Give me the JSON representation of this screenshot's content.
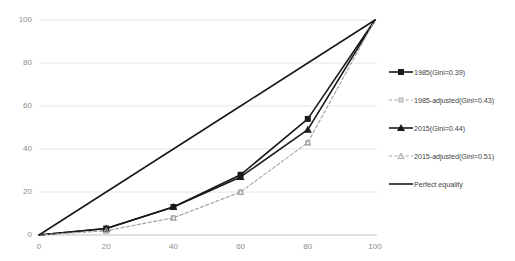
{
  "chart_data": {
    "type": "line",
    "title": "",
    "subtitle": "",
    "xlabel": "",
    "ylabel": "",
    "xlim": [
      0,
      100
    ],
    "ylim": [
      0,
      100
    ],
    "xticks": [
      "0",
      "20",
      "40",
      "60",
      "80",
      "100"
    ],
    "yticks": [
      "0",
      "20",
      "40",
      "60",
      "80",
      "100"
    ],
    "grid": true,
    "legend_position": "right",
    "x": [
      0,
      20,
      40,
      60,
      80,
      100
    ],
    "series": [
      {
        "name": "1985(Gini=0.39)",
        "values": [
          0,
          3,
          13,
          28,
          54,
          100
        ],
        "style": "solid",
        "marker": "square",
        "color": "#1a1a1a"
      },
      {
        "name": "1985-adjusted(Gini=0.43)",
        "values": [
          0,
          2,
          8,
          20,
          43,
          100
        ],
        "style": "dashed",
        "marker": "square-small",
        "color": "#a6a6a6"
      },
      {
        "name": "2015(Gini=0.44)",
        "values": [
          0,
          3,
          13,
          27,
          49,
          100
        ],
        "style": "solid",
        "marker": "triangle",
        "color": "#1a1a1a"
      },
      {
        "name": "2015-adjusted(Gini=0.51)",
        "values": [
          0,
          2,
          8,
          20,
          43,
          100
        ],
        "style": "dashed",
        "marker": "triangle-small",
        "color": "#a6a6a6"
      },
      {
        "name": "Perfect equality",
        "values": [
          0,
          20,
          40,
          60,
          80,
          100
        ],
        "style": "solid",
        "marker": "none",
        "color": "#1a1a1a"
      }
    ]
  },
  "axes": {
    "y_labels": [
      "100",
      "80",
      "60",
      "40",
      "20",
      "0"
    ],
    "x_labels": [
      "0",
      "20",
      "40",
      "60",
      "80",
      "100"
    ]
  },
  "legend": {
    "items": [
      {
        "label": "1985(Gini=0.39)"
      },
      {
        "label": "1985-adjusted(Gini=0.43)"
      },
      {
        "label": "2015(Gini=0.44)"
      },
      {
        "label": "2015-adjusted(Gini=0.51)"
      },
      {
        "label": "Perfect equality"
      }
    ]
  },
  "colors": {
    "series_dark": "#1a1a1a",
    "series_light": "#a6a6a6",
    "grid": "#e4e4e4",
    "tick_text": "#8c8c8c",
    "legend_text": "#3f3f3f"
  }
}
